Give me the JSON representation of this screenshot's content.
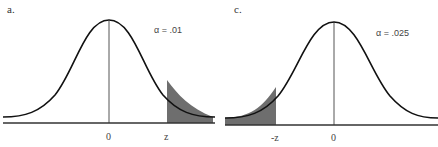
{
  "panels": [
    {
      "label": "a.",
      "alpha_text": "α = .01",
      "tick_center": "0",
      "tick_critical": "z",
      "tail": "right"
    },
    {
      "label": "c.",
      "alpha_text": "α = .025",
      "tick_center": "0",
      "tick_critical": "-z",
      "tail": "left"
    }
  ],
  "colors": {
    "curve": "#111111",
    "shade": "#6e6e6e",
    "axis": "#333333",
    "center_line": "#555555"
  }
}
